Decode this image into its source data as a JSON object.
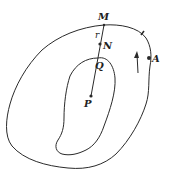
{
  "diagram": {
    "labels": {
      "M": "M",
      "r": "r",
      "N": "N",
      "Q": "Q",
      "P": "P",
      "A": "A"
    },
    "points": [
      {
        "name": "M",
        "x": 104,
        "y": 25
      },
      {
        "name": "N",
        "x": 100,
        "y": 44
      },
      {
        "name": "Q",
        "x": 98,
        "y": 58
      },
      {
        "name": "P",
        "x": 91,
        "y": 96
      },
      {
        "name": "A",
        "x": 149,
        "y": 58
      }
    ],
    "arrow": {
      "direction": "up",
      "meaning": "direction of traversal"
    },
    "colors": {
      "ink": "#2a2a2a",
      "background": "#ffffff"
    }
  }
}
